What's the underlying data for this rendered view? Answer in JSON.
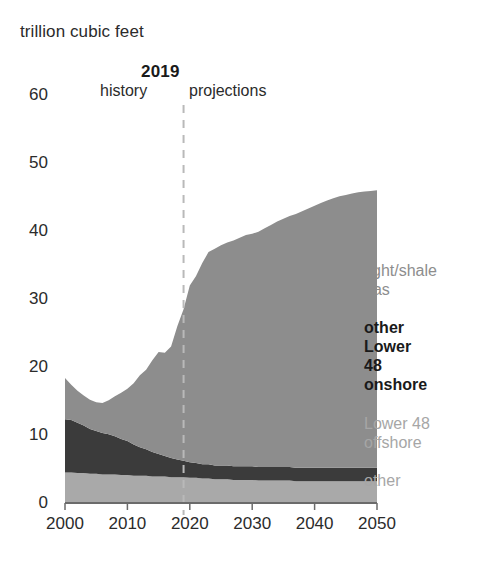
{
  "axis_title": "trillion cubic feet",
  "divider": {
    "year_label": "2019",
    "history_label": "history",
    "projections_label": "projections"
  },
  "legend": {
    "tight_shale_gas": "tight/shale gas",
    "other_lower_48_onshore": "other Lower 48 onshore",
    "lower_48_offshore": "Lower 48 offshore",
    "other": "other"
  },
  "colors": {
    "tight_shale_gas": "#8d8d8d",
    "other_lower_48_onshore": "#3b3b3b",
    "lower_48_offshore": "#a9a9a9",
    "other": "#a9a9a9",
    "axis": "#6b6b6b",
    "divider_line": "#b9b9b9",
    "text": "#2b2b2b"
  },
  "chart_data": {
    "type": "area",
    "stacked": true,
    "title": "",
    "subtitle": "",
    "xlabel": "",
    "ylabel": "trillion cubic feet",
    "xlim": [
      2000,
      2050
    ],
    "ylim": [
      0,
      60
    ],
    "xticks": [
      2000,
      2010,
      2020,
      2030,
      2040,
      2050
    ],
    "yticks": [
      0,
      10,
      20,
      30,
      40,
      50,
      60
    ],
    "grid": false,
    "legend_position": "right-inside",
    "annotations": [
      {
        "type": "vline",
        "x": 2019,
        "style": "dashed",
        "label": "2019"
      },
      {
        "type": "text",
        "x": 2010,
        "label": "history"
      },
      {
        "type": "text",
        "x": 2030,
        "label": "projections"
      }
    ],
    "x": [
      2000,
      2001,
      2002,
      2003,
      2004,
      2005,
      2006,
      2007,
      2008,
      2009,
      2010,
      2011,
      2012,
      2013,
      2014,
      2015,
      2016,
      2017,
      2018,
      2019,
      2020,
      2021,
      2022,
      2023,
      2024,
      2025,
      2026,
      2027,
      2028,
      2029,
      2030,
      2031,
      2032,
      2033,
      2034,
      2035,
      2036,
      2037,
      2038,
      2039,
      2040,
      2041,
      2042,
      2043,
      2044,
      2045,
      2046,
      2047,
      2048,
      2049,
      2050
    ],
    "series": [
      {
        "name": "other",
        "order": 1,
        "color": "#a9a9a9",
        "values": [
          4.5,
          4.5,
          4.4,
          4.4,
          4.3,
          4.3,
          4.2,
          4.2,
          4.2,
          4.1,
          4.1,
          4.0,
          4.0,
          4.0,
          3.9,
          3.9,
          3.9,
          3.8,
          3.8,
          3.8,
          3.7,
          3.7,
          3.6,
          3.6,
          3.5,
          3.5,
          3.5,
          3.4,
          3.4,
          3.4,
          3.4,
          3.3,
          3.3,
          3.3,
          3.3,
          3.3,
          3.3,
          3.2,
          3.2,
          3.2,
          3.2,
          3.2,
          3.2,
          3.2,
          3.2,
          3.2,
          3.2,
          3.2,
          3.2,
          3.2,
          3.2
        ]
      },
      {
        "name": "Lower 48 offshore",
        "order": 2,
        "color": "#a9a9a9",
        "values": [
          0.0,
          0.0,
          0.0,
          0.0,
          0.0,
          0.0,
          0.0,
          0.0,
          0.0,
          0.0,
          0.0,
          0.0,
          0.0,
          0.0,
          0.0,
          0.0,
          0.0,
          0.0,
          0.0,
          0.0,
          0.0,
          0.0,
          0.0,
          0.0,
          0.0,
          0.0,
          0.0,
          0.0,
          0.0,
          0.0,
          0.0,
          0.0,
          0.0,
          0.0,
          0.0,
          0.0,
          0.0,
          0.0,
          0.0,
          0.0,
          0.0,
          0.0,
          0.0,
          0.0,
          0.0,
          0.0,
          0.0,
          0.0,
          0.0,
          0.0,
          0.0
        ]
      },
      {
        "name": "other Lower 48 onshore",
        "order": 3,
        "color": "#3b3b3b",
        "values": [
          7.8,
          7.7,
          7.4,
          7.0,
          6.6,
          6.3,
          6.1,
          5.9,
          5.6,
          5.3,
          5.0,
          4.6,
          4.2,
          3.9,
          3.6,
          3.3,
          3.0,
          2.8,
          2.6,
          2.4,
          2.3,
          2.2,
          2.1,
          2.1,
          2.0,
          2.0,
          2.0,
          2.0,
          2.0,
          2.0,
          2.0,
          2.0,
          2.0,
          2.0,
          2.0,
          2.0,
          2.0,
          2.0,
          2.0,
          2.0,
          2.0,
          2.0,
          2.0,
          2.0,
          2.0,
          2.0,
          2.0,
          2.0,
          2.0,
          2.0,
          2.0
        ]
      },
      {
        "name": "tight/shale gas",
        "order": 4,
        "color": "#8d8d8d",
        "values": [
          6.1,
          5.2,
          4.7,
          4.4,
          4.3,
          4.2,
          4.4,
          5.0,
          5.9,
          6.8,
          7.7,
          9.0,
          10.6,
          11.7,
          13.5,
          15.0,
          15.2,
          16.4,
          19.6,
          22.3,
          26.0,
          27.5,
          29.6,
          31.2,
          31.9,
          32.4,
          32.8,
          33.2,
          33.6,
          34.0,
          34.2,
          34.6,
          35.1,
          35.6,
          36.1,
          36.5,
          36.9,
          37.3,
          37.7,
          38.1,
          38.5,
          38.9,
          39.3,
          39.6,
          39.9,
          40.1,
          40.3,
          40.5,
          40.6,
          40.7,
          40.8
        ]
      }
    ],
    "totals": [
      18.4,
      17.4,
      16.5,
      15.8,
      15.2,
      14.8,
      14.7,
      15.1,
      15.7,
      16.2,
      16.8,
      17.6,
      18.8,
      19.6,
      21.0,
      22.2,
      22.1,
      23.0,
      26.0,
      28.5,
      32.0,
      33.4,
      35.3,
      36.9,
      37.4,
      37.9,
      38.3,
      38.6,
      39.0,
      39.4,
      39.6,
      39.9,
      40.4,
      40.9,
      41.4,
      41.8,
      42.2,
      42.5,
      42.9,
      43.3,
      43.7,
      44.1,
      44.5,
      44.8,
      45.1,
      45.3,
      45.5,
      45.7,
      45.8,
      45.9,
      46.0
    ]
  }
}
